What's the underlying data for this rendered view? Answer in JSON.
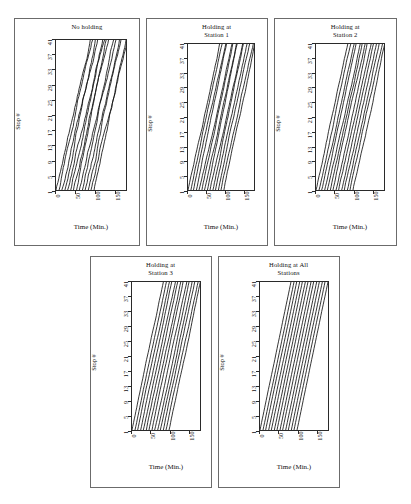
{
  "figure": {
    "background": "#ffffff",
    "panel_border_color": "#6b6b6b",
    "axis_color": "#2a2a2a",
    "line_color": "#111111"
  },
  "axes": {
    "ylabel": "Stop #",
    "xlabel": "Time (Min.)",
    "yticks": [
      "41",
      "37",
      "33",
      "29",
      "25",
      "21",
      "17",
      "13",
      "9",
      "5",
      "1"
    ],
    "xticks": [
      "0",
      "50",
      "100",
      "150"
    ],
    "ylim": [
      1,
      41
    ],
    "xlim": [
      0,
      180
    ],
    "xtick_values": [
      0,
      50,
      100,
      150
    ],
    "ytick_values": [
      41,
      37,
      33,
      29,
      25,
      21,
      17,
      13,
      9,
      5,
      1
    ]
  },
  "panels": [
    {
      "id": "no-holding",
      "title": "No holding",
      "title_lines": "No holding"
    },
    {
      "id": "holding-station-1",
      "title": "Holding at Station 1",
      "title_lines": "Holding at\nStation 1"
    },
    {
      "id": "holding-station-2",
      "title": "Holding at Station 2",
      "title_lines": "Holding at\nStation 2"
    },
    {
      "id": "holding-station-3",
      "title": "Holding at Station 3",
      "title_lines": "Holding at\nStation 3"
    },
    {
      "id": "holding-all-stations",
      "title": "Holding at All Stations",
      "title_lines": "Holding at All\nStations"
    }
  ],
  "chart_data": {
    "type": "line",
    "xlabel": "Time (Min.)",
    "ylabel": "Stop #",
    "xlim": [
      0,
      180
    ],
    "ylim": [
      1,
      41
    ],
    "xticks": [
      0,
      50,
      100,
      150
    ],
    "yticks": [
      41,
      37,
      33,
      29,
      25,
      21,
      17,
      13,
      9,
      5,
      1
    ],
    "grid": false,
    "legend": null,
    "x_is_time_minutes": true,
    "y_is_stop_index": true,
    "panels": [
      {
        "name": "No holding",
        "n_vehicles": 14,
        "departure_times": [
          0,
          8,
          15,
          23,
          30,
          38,
          45,
          53,
          60,
          68,
          75,
          83,
          90,
          98
        ],
        "travel_time_to_last_stop": [
          88,
          86,
          92,
          78,
          95,
          82,
          90,
          76,
          94,
          80,
          88,
          84,
          90,
          86
        ],
        "bunching": "severe",
        "note": "Headways degrade; trajectories converge into pairs/triples by the upper stops."
      },
      {
        "name": "Holding at Station 1",
        "n_vehicles": 14,
        "departure_times": [
          0,
          8,
          15,
          23,
          30,
          38,
          45,
          53,
          60,
          68,
          75,
          83,
          90,
          98
        ],
        "travel_time_to_last_stop": [
          86,
          85,
          88,
          82,
          90,
          84,
          87,
          81,
          89,
          83,
          86,
          85,
          88,
          84
        ],
        "bunching": "moderate",
        "hold_stops": [
          1
        ],
        "note": "Holding only at the first station partially regularises early headways."
      },
      {
        "name": "Holding at Station 2",
        "n_vehicles": 14,
        "departure_times": [
          0,
          8,
          15,
          23,
          30,
          38,
          45,
          53,
          60,
          68,
          75,
          83,
          90,
          98
        ],
        "travel_time_to_last_stop": [
          84,
          84,
          86,
          83,
          87,
          84,
          85,
          82,
          86,
          84,
          85,
          84,
          86,
          84
        ],
        "bunching": "moderate",
        "hold_stops": [
          2
        ],
        "note": "Trajectories kink at the holding stop then resume roughly parallel."
      },
      {
        "name": "Holding at Station 3",
        "n_vehicles": 14,
        "departure_times": [
          0,
          8,
          15,
          23,
          30,
          38,
          45,
          53,
          60,
          68,
          75,
          83,
          90,
          98
        ],
        "travel_time_to_last_stop": [
          83,
          83,
          84,
          82,
          85,
          83,
          84,
          82,
          85,
          83,
          84,
          83,
          85,
          83
        ],
        "bunching": "mild",
        "hold_stops": [
          3
        ],
        "note": "Headways hold more evenly over the whole corridor."
      },
      {
        "name": "Holding at All Stations",
        "n_vehicles": 14,
        "departure_times": [
          0,
          8,
          15,
          23,
          30,
          38,
          45,
          53,
          60,
          68,
          75,
          83,
          90,
          98
        ],
        "travel_time_to_last_stop": [
          82,
          82,
          82,
          82,
          82,
          82,
          82,
          82,
          82,
          82,
          82,
          82,
          82,
          82
        ],
        "bunching": "minimal",
        "hold_stops": [
          1,
          2,
          3,
          4,
          5,
          6,
          7,
          8,
          9,
          10
        ],
        "note": "Nearly parallel, evenly spaced trajectories — headways preserved end to end."
      }
    ]
  }
}
